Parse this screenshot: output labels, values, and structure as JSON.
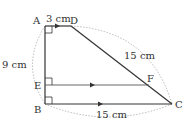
{
  "diagram": {
    "type": "geometry-trapezoid",
    "colors": {
      "line": "#333333",
      "dotted": "#aaaaaa",
      "text": "#333333"
    },
    "points": {
      "A": {
        "label": "A",
        "x": 45,
        "y": 26
      },
      "D": {
        "label": "D",
        "x": 71,
        "y": 26
      },
      "B": {
        "label": "B",
        "x": 45,
        "y": 104
      },
      "C": {
        "label": "C",
        "x": 172,
        "y": 104
      },
      "E": {
        "label": "E",
        "x": 45,
        "y": 85
      },
      "F": {
        "label": "F",
        "x": 149,
        "y": 85
      }
    },
    "measurements": {
      "AD": "3 cm",
      "AB": "9 cm",
      "DC": "15 cm",
      "BC": "15 cm"
    }
  }
}
